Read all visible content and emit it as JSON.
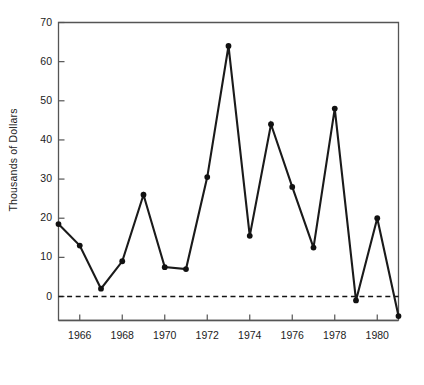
{
  "chart_data": {
    "type": "line",
    "title": "",
    "xlabel": "Years",
    "ylabel": "Thousands of Dollars",
    "x": [
      1965,
      1966,
      1967,
      1968,
      1969,
      1970,
      1971,
      1972,
      1973,
      1974,
      1975,
      1976,
      1977,
      1978,
      1979,
      1980,
      1981
    ],
    "values": [
      18.5,
      13,
      2,
      9,
      26,
      7.5,
      7,
      30.5,
      64,
      15.5,
      44,
      28,
      12.5,
      48,
      -1,
      20,
      -5
    ],
    "series": [
      {
        "name": "",
        "values": [
          18.5,
          13,
          2,
          9,
          26,
          7.5,
          7,
          30.5,
          64,
          15.5,
          44,
          28,
          12.5,
          48,
          -1,
          20,
          -5
        ]
      }
    ],
    "xlim": [
      1965,
      1981
    ],
    "ylim": [
      -6,
      70
    ],
    "yticks": [
      0,
      10,
      20,
      30,
      40,
      50,
      60,
      70
    ],
    "ytick_labels": [
      "0",
      "10",
      "20",
      "30",
      "40",
      "50",
      "60",
      "70"
    ],
    "xticks": [
      1966,
      1968,
      1970,
      1972,
      1974,
      1976,
      1978,
      1980
    ],
    "xtick_labels": [
      "1966",
      "1968",
      "1970",
      "1972",
      "1974",
      "1976",
      "1978",
      "1980"
    ],
    "grid": false,
    "legend": "none",
    "zero_reference_line": {
      "value": 0,
      "style": "dashed"
    },
    "marker": "circle",
    "line_color": "#1a1a1a",
    "marker_color": "#111111",
    "axis_color": "#555555"
  }
}
